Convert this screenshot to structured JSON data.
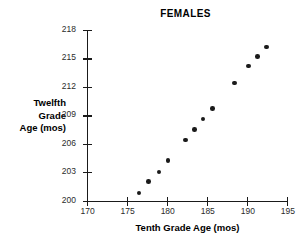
{
  "chart_data": {
    "type": "scatter",
    "title": "FEMALES",
    "xlabel": "Tenth Grade Age (mos)",
    "ylabel": "Twelfth Grade Age (mos)",
    "ylabel_lines": [
      "Twelfth",
      "Grade",
      "Age (mos)"
    ],
    "xlim": [
      170,
      195.1
    ],
    "ylim": [
      200,
      218
    ],
    "xticks": [
      170,
      175,
      180,
      185,
      190,
      195
    ],
    "yticks": [
      200,
      203,
      206,
      209,
      212,
      215,
      218
    ],
    "xtick_labels": [
      "170",
      "175",
      "180",
      "185",
      "190",
      "195"
    ],
    "ytick_labels": [
      "200",
      "203",
      "206",
      "209",
      "212",
      "215",
      "218"
    ],
    "grid": false,
    "legend": null,
    "marker": "filled-circle",
    "marker_color": "#1a1a1a",
    "axis_color": "#1a1a1a",
    "background_color": "#ffffff",
    "points": [
      {
        "x": 176.5,
        "y": 200.8
      },
      {
        "x": 177.7,
        "y": 202.0
      },
      {
        "x": 179.0,
        "y": 203.0
      },
      {
        "x": 180.1,
        "y": 204.2
      },
      {
        "x": 182.3,
        "y": 206.4
      },
      {
        "x": 183.4,
        "y": 207.5
      },
      {
        "x": 184.5,
        "y": 208.6
      },
      {
        "x": 185.7,
        "y": 209.7
      },
      {
        "x": 188.4,
        "y": 212.4
      },
      {
        "x": 190.2,
        "y": 214.2
      },
      {
        "x": 191.3,
        "y": 215.2
      },
      {
        "x": 192.4,
        "y": 216.2
      }
    ]
  }
}
